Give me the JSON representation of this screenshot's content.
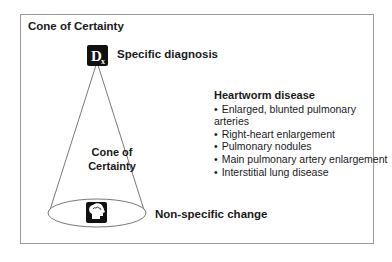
{
  "diagram": {
    "title": "Cone of Certainty",
    "top_label": "Specific diagnosis",
    "top_icon": "dx-icon",
    "top_icon_text": "D",
    "top_icon_sub": "x",
    "cone_label_line1": "Cone of",
    "cone_label_line2": "Certainty",
    "bottom_label": "Non-specific change",
    "bottom_icon": "brain-head-icon"
  },
  "findings": {
    "title": "Heartworm disease",
    "items": [
      "Enlarged, blunted pulmonary arteries",
      "Right-heart enlargement",
      "Pulmonary nodules",
      "Main pulmonary artery enlargement",
      "Interstitial lung disease"
    ]
  },
  "colors": {
    "border": "#9a9a9a",
    "icon_bg": "#111111",
    "text": "#1a1a1a"
  }
}
